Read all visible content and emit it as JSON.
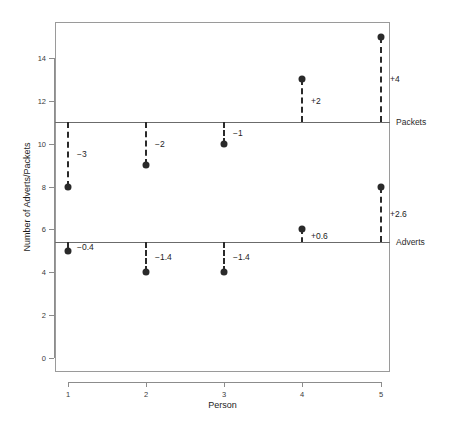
{
  "chart_data": {
    "type": "scatter",
    "title": "",
    "xlabel": "Person",
    "ylabel": "Number of Adverts/Packets",
    "xlim": [
      0.6,
      5.4
    ],
    "ylim": [
      -0.7,
      15.7
    ],
    "grid": false,
    "legend": "none",
    "x_tick_labels": [
      "1",
      "2",
      "3",
      "4",
      "5"
    ],
    "x_tick_values": [
      1,
      2,
      3,
      4,
      5
    ],
    "y_tick_labels": [
      "0",
      "2",
      "4",
      "6",
      "8",
      "10",
      "12",
      "14"
    ],
    "y_tick_values": [
      0,
      2,
      4,
      6,
      8,
      10,
      12,
      14
    ],
    "reference_lines": [
      {
        "name": "Packets",
        "label": "Packets",
        "value": 11
      },
      {
        "name": "Adverts",
        "label": "Adverts",
        "value": 5.4
      }
    ],
    "series": [
      {
        "name": "Packets",
        "reference": 11,
        "points": [
          {
            "x": 1,
            "y": 8,
            "delta": "−3",
            "delta_value": -3
          },
          {
            "x": 2,
            "y": 9,
            "delta": "−2",
            "delta_value": -2
          },
          {
            "x": 3,
            "y": 10,
            "delta": "−1",
            "delta_value": -1
          },
          {
            "x": 4,
            "y": 13,
            "delta": "+2",
            "delta_value": 2
          },
          {
            "x": 5,
            "y": 15,
            "delta": "+4",
            "delta_value": 4
          }
        ]
      },
      {
        "name": "Adverts",
        "reference": 5.4,
        "points": [
          {
            "x": 1,
            "y": 5,
            "delta": "−0.4",
            "delta_value": -0.4
          },
          {
            "x": 2,
            "y": 4,
            "delta": "−1.4",
            "delta_value": -1.4
          },
          {
            "x": 3,
            "y": 4,
            "delta": "−1.4",
            "delta_value": -1.4
          },
          {
            "x": 4,
            "y": 6,
            "delta": "+0.6",
            "delta_value": 0.6
          },
          {
            "x": 5,
            "y": 8,
            "delta": "+2.6",
            "delta_value": 2.6
          }
        ]
      }
    ],
    "colors": {
      "marker": "#2a2a2a",
      "reference_line": "#6b6b6b",
      "frame": "#9a9a9a",
      "text": "#1d1d1d",
      "background": "#ffffff"
    }
  }
}
